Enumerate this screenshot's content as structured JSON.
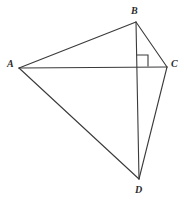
{
  "figure": {
    "background_color": "#ffffff",
    "stroke_color": "#3a3a3a",
    "label_color": "#2b2b2b",
    "stroke_width": 1
  },
  "vertices": [
    {
      "id": "A",
      "label": "A",
      "x": 19,
      "y": 68
    },
    {
      "id": "B",
      "label": "B",
      "x": 136,
      "y": 22
    },
    {
      "id": "C",
      "label": "C",
      "x": 167,
      "y": 67
    },
    {
      "id": "D",
      "label": "D",
      "x": 139,
      "y": 179
    }
  ],
  "segments": [
    {
      "id": "AB",
      "from": "A",
      "to": "B",
      "x1": 19,
      "y1": 68,
      "x2": 136,
      "y2": 22
    },
    {
      "id": "BC",
      "from": "B",
      "to": "C",
      "x1": 136,
      "y1": 22,
      "x2": 167,
      "y2": 67
    },
    {
      "id": "AC",
      "from": "A",
      "to": "C",
      "x1": 19,
      "y1": 68,
      "x2": 167,
      "y2": 67
    },
    {
      "id": "AD",
      "from": "A",
      "to": "D",
      "x1": 19,
      "y1": 68,
      "x2": 139,
      "y2": 179
    },
    {
      "id": "CD",
      "from": "C",
      "to": "D",
      "x1": 167,
      "y1": 67,
      "x2": 139,
      "y2": 179
    },
    {
      "id": "BD",
      "from": "B",
      "to": "D",
      "x1": 136,
      "y1": 22,
      "x2": 139,
      "y2": 179
    }
  ],
  "right_angle_marker": {
    "id": "right-angle-at-intersection",
    "vertex_x": 137,
    "vertex_y": 66,
    "size": 11,
    "path": "M 137 55 L 148 55 L 148 66"
  },
  "labels": {
    "A": "A",
    "B": "B",
    "C": "C",
    "D": "D"
  }
}
